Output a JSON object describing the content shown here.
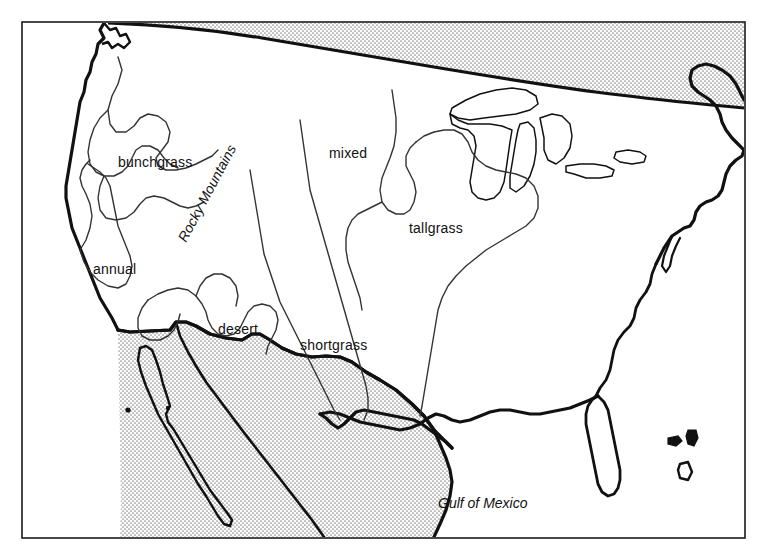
{
  "figure": {
    "frame": {
      "x": 22,
      "y": 22,
      "width": 723,
      "height": 516,
      "stroke": "#1a1a1a",
      "stroke_width": 1.6
    },
    "background_color": "#ffffff",
    "coastline_color": "#111111",
    "boundary_color": "#333333",
    "foreign_fill_color": "#dcdcdc",
    "stipple_dot_color": "#8a8a8a"
  },
  "labels": {
    "regions": [
      {
        "id": "bunchgrass",
        "text": "bunchgrass",
        "x": 118,
        "y": 167,
        "anchor": "start",
        "rotate": 0
      },
      {
        "id": "annual",
        "text": "annual",
        "x": 93,
        "y": 274,
        "anchor": "start",
        "rotate": 0
      },
      {
        "id": "desert",
        "text": "desert",
        "x": 218,
        "y": 334,
        "anchor": "start",
        "rotate": 0
      },
      {
        "id": "mixed",
        "text": "mixed",
        "x": 329,
        "y": 158,
        "anchor": "start",
        "rotate": 0
      },
      {
        "id": "shortgrass",
        "text": "shortgrass",
        "x": 300,
        "y": 350,
        "anchor": "start",
        "rotate": 0
      },
      {
        "id": "tallgrass",
        "text": "tallgrass",
        "x": 409,
        "y": 233,
        "anchor": "start",
        "rotate": 0
      }
    ],
    "ranges": [
      {
        "id": "rocky-mountains",
        "text": "Rocky Mountains",
        "x": 186,
        "y": 243,
        "rotate": -62
      }
    ],
    "water": [
      {
        "id": "gulf-of-mexico",
        "text": "Gulf of Mexico",
        "x": 438,
        "y": 508,
        "anchor": "start"
      }
    ]
  },
  "geography": {
    "shaded_areas": [
      {
        "id": "canada",
        "name": "Canada"
      },
      {
        "id": "mexico",
        "name": "Mexico"
      },
      {
        "id": "baja-california",
        "name": "Baja California"
      }
    ],
    "coast_features": [
      {
        "id": "pacific-coast",
        "name": "Pacific Coast"
      },
      {
        "id": "gulf-coast",
        "name": "Gulf Coast"
      },
      {
        "id": "atlantic-coast",
        "name": "Atlantic Coast"
      },
      {
        "id": "florida-peninsula",
        "name": "Florida Peninsula"
      },
      {
        "id": "great-lakes",
        "name": "Great Lakes"
      },
      {
        "id": "bahamas-islands",
        "name": "Bahamas Islands"
      }
    ],
    "region_boundaries": [
      {
        "id": "bunchgrass-boundary",
        "name": "bunchgrass region boundary"
      },
      {
        "id": "annual-boundary",
        "name": "annual region boundary"
      },
      {
        "id": "desert-boundary",
        "name": "desert region boundary"
      },
      {
        "id": "mixed-boundary",
        "name": "mixed region boundary"
      },
      {
        "id": "shortgrass-boundary",
        "name": "shortgrass region boundary"
      },
      {
        "id": "tallgrass-boundary",
        "name": "tallgrass region boundary"
      }
    ]
  }
}
